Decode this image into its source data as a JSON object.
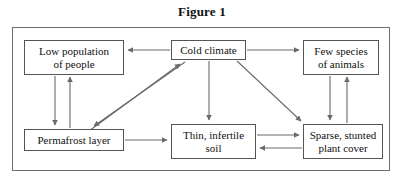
{
  "figure": {
    "title": "Figure 1"
  },
  "diagram": {
    "type": "flowchart",
    "nodes": [
      {
        "id": "low-population",
        "label_line1": "Low population",
        "label_line2": "of people"
      },
      {
        "id": "cold-climate",
        "label_line1": "Cold climate",
        "label_line2": ""
      },
      {
        "id": "few-species",
        "label_line1": "Few species",
        "label_line2": "of animals"
      },
      {
        "id": "permafrost",
        "label_line1": "Permafrost layer",
        "label_line2": ""
      },
      {
        "id": "thin-soil",
        "label_line1": "Thin, infertile",
        "label_line2": "soil"
      },
      {
        "id": "sparse-cover",
        "label_line1": "Sparse, stunted",
        "label_line2": "plant cover"
      }
    ],
    "edges": [
      {
        "from": "cold-climate",
        "to": "low-population",
        "direction": "one-way"
      },
      {
        "from": "cold-climate",
        "to": "few-species",
        "direction": "one-way"
      },
      {
        "from": "cold-climate",
        "to": "thin-soil",
        "direction": "one-way"
      },
      {
        "from": "cold-climate",
        "to": "sparse-cover",
        "direction": "one-way"
      },
      {
        "from": "cold-climate",
        "to": "permafrost",
        "direction": "two-way"
      },
      {
        "from": "low-population",
        "to": "permafrost",
        "direction": "two-way"
      },
      {
        "from": "permafrost",
        "to": "thin-soil",
        "direction": "one-way"
      },
      {
        "from": "thin-soil",
        "to": "sparse-cover",
        "direction": "two-way"
      },
      {
        "from": "few-species",
        "to": "sparse-cover",
        "direction": "two-way"
      }
    ]
  },
  "colors": {
    "frame_border": "#6d6d6d",
    "node_border": "#555555",
    "arrow": "#6a6a6a",
    "text": "#101010",
    "background": "#ffffff"
  }
}
